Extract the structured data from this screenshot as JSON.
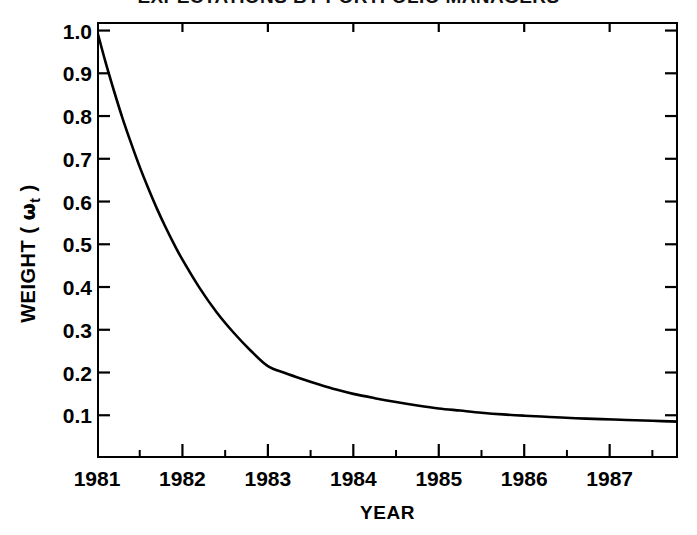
{
  "chart_data": {
    "type": "line",
    "title": "EXPECTATIONS BY PORTFOLIO MANAGERS",
    "xlabel": "YEAR",
    "ylabel": "WEIGHT ( ωt )",
    "ylabel_parts": {
      "prefix": "WEIGHT ( ",
      "symbol": "ω",
      "subscript": "t",
      "suffix": " )"
    },
    "grid": false,
    "legend": null,
    "xlim": [
      1981.0,
      1987.8
    ],
    "ylim": [
      0.0,
      1.02
    ],
    "x_ticks": [
      1981,
      1982,
      1983,
      1984,
      1985,
      1986,
      1987
    ],
    "x_tick_labels": [
      "1981",
      "1982",
      "1983",
      "1984",
      "1985",
      "1986",
      "1987"
    ],
    "x_minor_ticks": [
      1981.5,
      1982.5,
      1983.5,
      1984.5,
      1985.5,
      1986.5,
      1987.5
    ],
    "y_ticks": [
      1.0,
      0.9,
      0.8,
      0.7,
      0.6,
      0.5,
      0.4,
      0.3,
      0.2,
      0.1
    ],
    "y_tick_labels": [
      "1.0",
      "0.9",
      "0.8",
      "0.7",
      "0.6",
      "0.5",
      "0.4",
      "0.3",
      "0.2",
      "0.1"
    ],
    "series": [
      {
        "name": "weight",
        "color": "#000000",
        "x": [
          1981.0,
          1981.1,
          1981.2,
          1981.3,
          1981.4,
          1981.5,
          1981.6,
          1981.7,
          1981.8,
          1981.9,
          1982.0,
          1982.2,
          1982.4,
          1982.6,
          1982.8,
          1983.0,
          1983.2,
          1983.4,
          1983.6,
          1983.8,
          1984.0,
          1984.25,
          1984.5,
          1984.75,
          1985.0,
          1985.25,
          1985.5,
          1985.75,
          1986.0,
          1986.3,
          1986.6,
          1986.9,
          1987.2,
          1987.5,
          1987.8
        ],
        "y": [
          1.0,
          0.926,
          0.858,
          0.794,
          0.736,
          0.681,
          0.631,
          0.584,
          0.541,
          0.501,
          0.464,
          0.398,
          0.341,
          0.293,
          0.251,
          0.215,
          0.199,
          0.185,
          0.172,
          0.16,
          0.15,
          0.14,
          0.131,
          0.123,
          0.116,
          0.111,
          0.106,
          0.102,
          0.099,
          0.096,
          0.093,
          0.091,
          0.089,
          0.087,
          0.085
        ]
      }
    ]
  }
}
